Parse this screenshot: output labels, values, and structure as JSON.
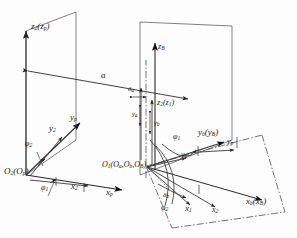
{
  "figure": {
    "type": "3d-kinematic-coordinate-frame-diagram"
  },
  "labels": {
    "z2_zp": {
      "base": "z",
      "sub": "2",
      "paren_base": "z",
      "paren_sub": "p",
      "x": 26,
      "y": 26
    },
    "a_distance": {
      "text": "a",
      "x": 101,
      "y": 80
    },
    "zB": {
      "base": "z",
      "sub": "B",
      "x": 155,
      "y": 48
    },
    "delta_a": {
      "base": "δ",
      "sub": "a",
      "x": 131,
      "y": 91
    },
    "z2_z1": {
      "base": "z",
      "sub": "2",
      "paren_base": "z",
      "paren_sub": "1",
      "x": 157,
      "y": 102
    },
    "gamma_a": {
      "base": "γ",
      "sub": "a",
      "x": 136,
      "y": 112
    },
    "gamma_b": {
      "base": "γ",
      "sub": "b",
      "x": 158,
      "y": 122
    },
    "yp": {
      "base": "y",
      "sub": "p",
      "x": 71,
      "y": 118
    },
    "y2": {
      "base": "y",
      "sub": "2",
      "x": 50,
      "y": 128
    },
    "phi2": {
      "base": "φ",
      "sub": "2",
      "x": 27,
      "y": 145
    },
    "O2_Op": {
      "base": "O",
      "sub": "2",
      "paren_base": "O",
      "paren_sub": "p",
      "x": 6,
      "y": 173
    },
    "phi1_lower": {
      "base": "φ",
      "sub": "1",
      "x": 43,
      "y": 190
    },
    "x2": {
      "base": "x",
      "sub": "2",
      "x": 72,
      "y": 187
    },
    "xp": {
      "base": "x",
      "sub": "p",
      "x": 107,
      "y": 193
    },
    "O1_group": {
      "text": "O",
      "sub": "1",
      "inner": "(O",
      "inner_sub": "a",
      "inner2": ",O",
      "inner2_sub": "b",
      "inner3": ",O",
      "inner3_sub": "B",
      "close": ")",
      "x": 103,
      "y": 168
    },
    "phi1_upper": {
      "base": "φ",
      "sub": "1",
      "x": 175,
      "y": 138
    },
    "y1": {
      "base": "y",
      "sub": "1",
      "x": 182,
      "y": 156
    },
    "yb_yB": {
      "base": "y",
      "sub": "b",
      "paren_base": "y",
      "paren_sub": "B",
      "x": 199,
      "y": 133
    },
    "yp_right": {
      "base": "y",
      "sub": "p",
      "x": 228,
      "y": 143
    },
    "delta_b": {
      "base": "δ",
      "sub": "b",
      "x": 166,
      "y": 198
    },
    "phi2_right": {
      "base": "φ",
      "sub": "2",
      "x": 163,
      "y": 210
    },
    "x1": {
      "base": "x",
      "sub": "1",
      "x": 186,
      "y": 210
    },
    "x2_right": {
      "base": "x",
      "sub": "2",
      "x": 213,
      "y": 212
    },
    "xb_xB": {
      "base": "x",
      "sub": "b",
      "paren_base": "x",
      "paren_sub": "B",
      "x": 247,
      "y": 202
    }
  },
  "colors": {
    "line": "#2b2b2b",
    "thin": "#4a4a4a",
    "dashdot": "#3a3a3a",
    "background": "#fdfdfd"
  }
}
